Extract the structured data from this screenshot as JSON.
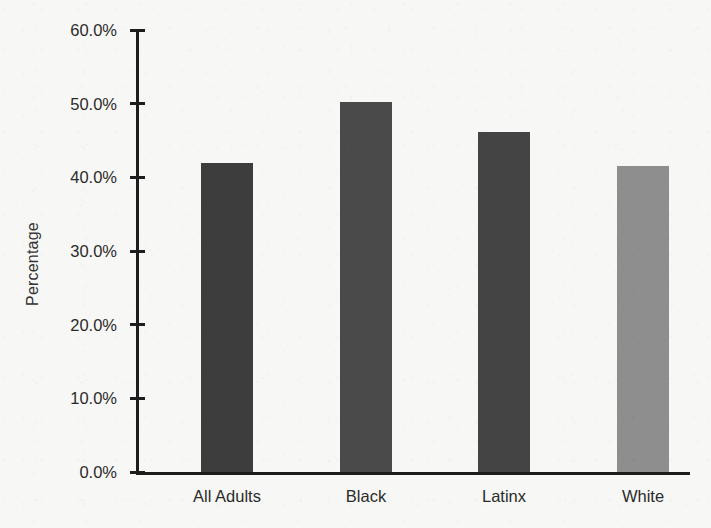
{
  "chart_data": {
    "type": "bar",
    "title": "",
    "subtitle": "",
    "xlabel": "",
    "ylabel": "Percentage",
    "categories": [
      "All Adults",
      "Black",
      "Latinx",
      "White"
    ],
    "values": [
      42.0,
      50.2,
      46.2,
      41.5
    ],
    "value_labels": [
      "42.0%",
      "50.2%",
      "46.2%",
      "41.5%"
    ],
    "series": [
      {
        "name": "Percentage",
        "values": [
          42.0,
          50.2,
          46.2,
          41.5
        ]
      }
    ],
    "bar_colors": [
      "#3d3d3d",
      "#4a4a4a",
      "#444444",
      "#8e8e8e"
    ],
    "ylim": [
      0,
      60
    ],
    "ytick_values": [
      60,
      50,
      40,
      30,
      20,
      10,
      0
    ],
    "ytick_labels": [
      "60.0%",
      "50.0%",
      "40.0%",
      "30.0%",
      "20.0%",
      "10.0%",
      "0.0%"
    ],
    "grid": false,
    "legend": false,
    "legend_position": "none"
  },
  "figure": {
    "background_color": "#f7f7f5",
    "axis_color": "#1d1d1d",
    "text_color": "#2b2b2b"
  }
}
